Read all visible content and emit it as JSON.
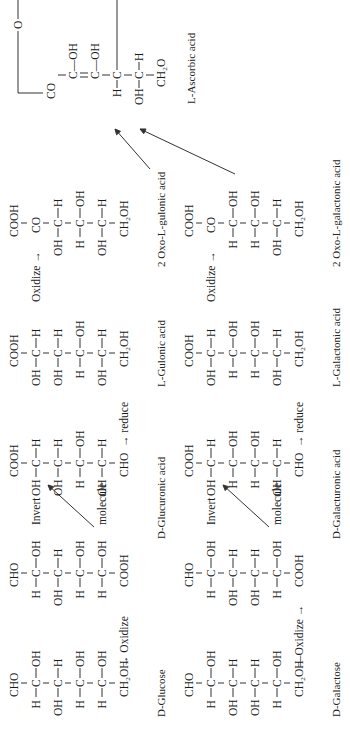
{
  "figure": {
    "pathways": [
      {
        "name": "glucose-pathway",
        "compounds": [
          {
            "id": "d-glucose",
            "label": "D-Glucose",
            "top": "CHO",
            "rows": [
              [
                "H",
                "C",
                "OH"
              ],
              [
                "OH",
                "C",
                "H"
              ],
              [
                "H",
                "C",
                "OH"
              ],
              [
                "H",
                "C",
                "OH"
              ]
            ],
            "bottom": "CH₂OH",
            "step_after": "→ Oxidize"
          },
          {
            "id": "d-glucuronic-acid",
            "label": "D-Glucuronic acid",
            "top": "CHO",
            "rows": [
              [
                "H",
                "C",
                "OH"
              ],
              [
                "OH",
                "C",
                "H"
              ],
              [
                "H",
                "C",
                "OH"
              ],
              [
                "H",
                "C",
                "OH"
              ]
            ],
            "bottom": "COOH",
            "annotation_1": "Invert",
            "annotation_2": "molecule"
          },
          {
            "id": "d-glucuronic-acid-inverted",
            "top": "COOH",
            "rows": [
              [
                "OH",
                "C",
                "H"
              ],
              [
                "OH",
                "C",
                "H"
              ],
              [
                "H",
                "C",
                "OH"
              ],
              [
                "OH",
                "C",
                "H"
              ]
            ],
            "bottom": "CHO",
            "step_after": "→ reduce"
          },
          {
            "id": "l-gulonic-acid",
            "label": "L-Gulonic acid",
            "top": "COOH",
            "rows": [
              [
                "OH",
                "C",
                "H"
              ],
              [
                "OH",
                "C",
                "H"
              ],
              [
                "H",
                "C",
                "OH"
              ],
              [
                "OH",
                "C",
                "H"
              ]
            ],
            "bottom": "CH₂OH",
            "step_after": "Oxidize →"
          },
          {
            "id": "2-oxo-l-gulonic-acid",
            "label": "2 Oxo-L-gulonic acid",
            "top": "COOH",
            "second": "CO",
            "rows": [
              [
                "OH",
                "C",
                "H"
              ],
              [
                "H",
                "C",
                "OH"
              ],
              [
                "OH",
                "C",
                "H"
              ]
            ],
            "bottom": "CH₂OH"
          }
        ]
      },
      {
        "name": "galactose-pathway",
        "compounds": [
          {
            "id": "d-galactose",
            "label": "D-Galactose",
            "top": "CHO",
            "rows": [
              [
                "H",
                "C",
                "OH"
              ],
              [
                "OH",
                "C",
                "H"
              ],
              [
                "OH",
                "C",
                "H"
              ],
              [
                "H",
                "C",
                "OH"
              ]
            ],
            "bottom": "CH₂OH",
            "step_after": "—Oxidize →"
          },
          {
            "id": "d-galacturonic-acid",
            "label": "D-Galacturonic acid",
            "top": "CHO",
            "rows": [
              [
                "H",
                "C",
                "OH"
              ],
              [
                "OH",
                "C",
                "H"
              ],
              [
                "OH",
                "C",
                "H"
              ],
              [
                "H",
                "C",
                "OH"
              ]
            ],
            "bottom": "COOH",
            "annotation_1": "Invert",
            "annotation_2": "molecule"
          },
          {
            "id": "d-galacturonic-acid-inverted",
            "top": "COOH",
            "rows": [
              [
                "OH",
                "C",
                "H"
              ],
              [
                "H",
                "C",
                "OH"
              ],
              [
                "H",
                "C",
                "OH"
              ],
              [
                "OH",
                "C",
                "H"
              ]
            ],
            "bottom": "CHO",
            "step_after": "→ reduce"
          },
          {
            "id": "l-galactonic-acid",
            "label": "L-Galactonic acid",
            "top": "COOH",
            "rows": [
              [
                "OH",
                "C",
                "H"
              ],
              [
                "H",
                "C",
                "OH"
              ],
              [
                "H",
                "C",
                "OH"
              ],
              [
                "OH",
                "C",
                "H"
              ]
            ],
            "bottom": "CH₂OH",
            "step_after": "Oxidize →"
          },
          {
            "id": "2-oxo-l-galactonic-acid",
            "label": "2 Oxo-L-galactonic acid",
            "top": "COOH",
            "second": "CO",
            "rows": [
              [
                "H",
                "C",
                "OH"
              ],
              [
                "H",
                "C",
                "OH"
              ],
              [
                "OH",
                "C",
                "H"
              ]
            ],
            "bottom": "CH₂OH"
          }
        ]
      }
    ],
    "product": {
      "id": "l-ascorbic-acid",
      "label": "L-Ascorbic acid",
      "ring_o": "O",
      "co": "CO",
      "c2": "C—OH",
      "c3": "C—OH",
      "c4": [
        "H",
        "C"
      ],
      "c5": [
        "OH",
        "C",
        "H"
      ],
      "bottom": "CH₂O"
    }
  }
}
